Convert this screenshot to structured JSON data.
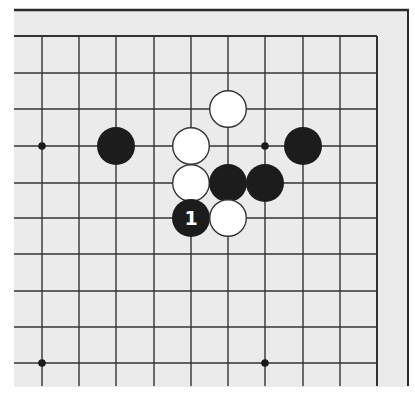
{
  "board": {
    "background": "#ebebeb",
    "line_color": "#333333",
    "frame_color": "#2a2a2a",
    "area": {
      "x": 14,
      "y": 10,
      "right": 409,
      "bottom": 387
    },
    "columns_x": [
      42,
      79,
      116,
      154,
      191,
      228,
      265,
      303,
      340,
      377
    ],
    "rows_y": [
      36,
      73,
      109,
      146,
      183,
      218,
      254,
      291,
      327,
      363
    ],
    "h_line_start_x": 14,
    "v_line_end_y": 386,
    "top_frame_y": 10,
    "right_frame_x": 408,
    "grid_right_x": 377,
    "grid_top_y": 36,
    "star_points": [
      {
        "col": 0,
        "row": 3
      },
      {
        "col": 6,
        "row": 3
      },
      {
        "col": 0,
        "row": 9
      },
      {
        "col": 6,
        "row": 9
      }
    ],
    "stone_radius": 19,
    "stones": [
      {
        "color": "white",
        "col": 5,
        "row": 2,
        "label": ""
      },
      {
        "color": "black",
        "col": 2,
        "row": 3,
        "label": ""
      },
      {
        "color": "white",
        "col": 4,
        "row": 3,
        "label": ""
      },
      {
        "color": "black",
        "col": 7,
        "row": 3,
        "label": ""
      },
      {
        "color": "white",
        "col": 4,
        "row": 4,
        "label": ""
      },
      {
        "color": "black",
        "col": 5,
        "row": 4,
        "label": ""
      },
      {
        "color": "black",
        "col": 6,
        "row": 4,
        "label": ""
      },
      {
        "color": "black",
        "col": 4,
        "row": 5,
        "label": "1"
      },
      {
        "color": "white",
        "col": 5,
        "row": 5,
        "label": ""
      }
    ],
    "colors": {
      "black_stone": "#1c1c1c",
      "white_stone": "#ffffff",
      "white_stone_border": "#333333",
      "label_on_black": "#ffffff"
    }
  }
}
